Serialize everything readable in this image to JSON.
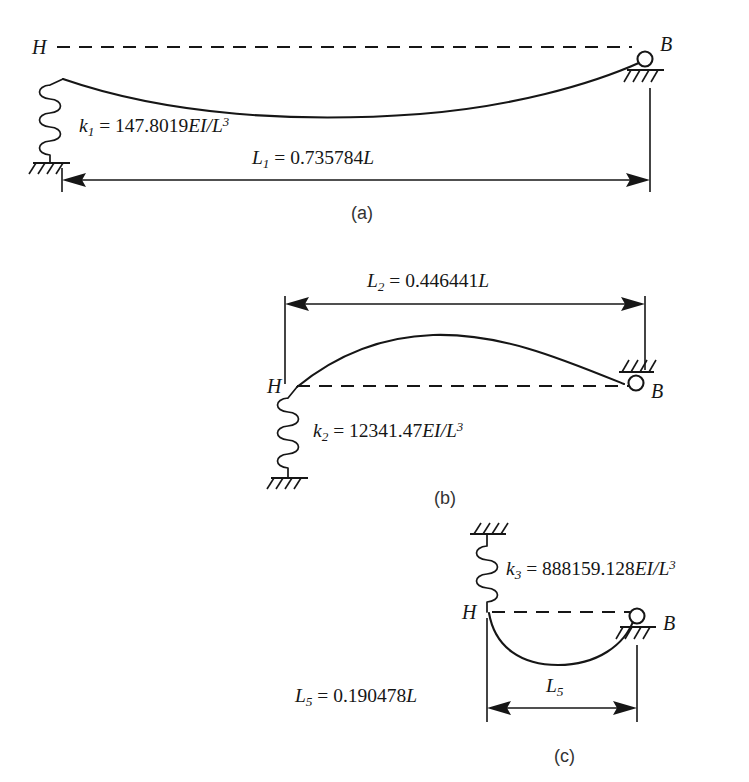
{
  "figure": {
    "ink_color": "#161616",
    "background_color": "#ffffff"
  },
  "panels": [
    {
      "id": "panel-a",
      "caption": "(a)",
      "left_node_label": "H",
      "right_node_label": "B",
      "spring": {
        "stiffness_symbol": "k",
        "stiffness_subscript": "1",
        "equals": "=",
        "coefficient": "147.8019",
        "flexural_term": "EI/L",
        "exponent": "3",
        "full_text": "k1 = 147.8019EI/L3"
      },
      "dimension": {
        "symbol": "L",
        "subscript": "1",
        "equals": "=",
        "value": "0.735784",
        "unit": "L",
        "full_text": "L1 = 0.735784L"
      }
    },
    {
      "id": "panel-b",
      "caption": "(b)",
      "left_node_label": "H",
      "right_node_label": "B",
      "spring": {
        "stiffness_symbol": "k",
        "stiffness_subscript": "2",
        "equals": "=",
        "coefficient": "12341.47",
        "flexural_term": "EI/L",
        "exponent": "3",
        "full_text": "k2 = 12341.47EI/L3"
      },
      "dimension": {
        "symbol": "L",
        "subscript": "2",
        "equals": "=",
        "value": "0.446441",
        "unit": "L",
        "full_text": "L2 = 0.446441L"
      }
    },
    {
      "id": "panel-c",
      "caption": "(c)",
      "left_node_label": "H",
      "right_node_label": "B",
      "spring": {
        "stiffness_symbol": "k",
        "stiffness_subscript": "3",
        "equals": "=",
        "coefficient": "888159.128",
        "flexural_term": "EI/L",
        "exponent": "3",
        "full_text": "k3 = 888159.128EI/L3"
      },
      "dimension_value": {
        "symbol": "L",
        "subscript": "5",
        "equals": "=",
        "value": "0.190478",
        "unit": "L",
        "full_text": "L5 = 0.190478L"
      },
      "dimension_arrow": {
        "symbol": "L",
        "subscript": "5",
        "full_text": "L5"
      }
    }
  ]
}
